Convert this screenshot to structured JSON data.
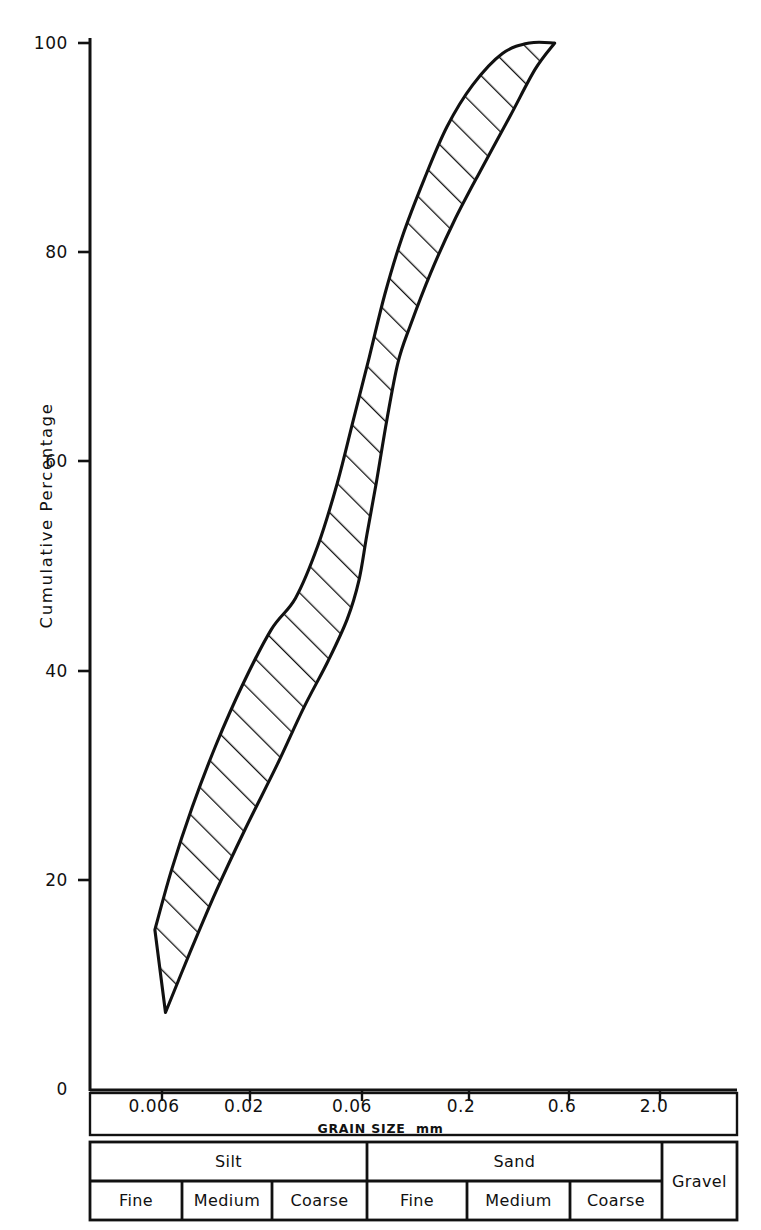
{
  "chart_data": {
    "type": "area",
    "title": "",
    "xlabel": "GRAIN SIZE  mm",
    "ylabel": "Cumulative  Percentage",
    "x_scale": "log",
    "x_ticks": [
      "0.006",
      "0.02",
      "0.06",
      "0.2",
      "0.6",
      "2.0"
    ],
    "x_tick_values": [
      0.006,
      0.02,
      0.06,
      0.2,
      0.6,
      2.0
    ],
    "y_ticks": [
      "0",
      "20",
      "40",
      "60",
      "80",
      "100"
    ],
    "y_tick_values": [
      0,
      20,
      40,
      60,
      80,
      100
    ],
    "ylim": [
      0,
      100
    ],
    "grid": false,
    "legend": "none",
    "series": [
      {
        "name": "coarse-limit (upper-left boundary)",
        "points": [
          {
            "size": 0.0062,
            "pct": 15.3
          },
          {
            "size": 0.0075,
            "pct": 21.0
          },
          {
            "size": 0.0095,
            "pct": 27.0
          },
          {
            "size": 0.0125,
            "pct": 33.0
          },
          {
            "size": 0.017,
            "pct": 38.8
          },
          {
            "size": 0.0235,
            "pct": 44.0
          },
          {
            "size": 0.031,
            "pct": 47.0
          },
          {
            "size": 0.04,
            "pct": 52.0
          },
          {
            "size": 0.05,
            "pct": 58.0
          },
          {
            "size": 0.06,
            "pct": 64.0
          },
          {
            "size": 0.072,
            "pct": 70.0
          },
          {
            "size": 0.086,
            "pct": 76.0
          },
          {
            "size": 0.105,
            "pct": 81.5
          },
          {
            "size": 0.135,
            "pct": 87.0
          },
          {
            "size": 0.175,
            "pct": 92.0
          },
          {
            "size": 0.235,
            "pct": 96.0
          },
          {
            "size": 0.33,
            "pct": 99.0
          },
          {
            "size": 0.45,
            "pct": 100.0
          },
          {
            "size": 0.6,
            "pct": 100.0
          }
        ]
      },
      {
        "name": "fine-limit (lower-right boundary)",
        "points": [
          {
            "size": 0.007,
            "pct": 7.4
          },
          {
            "size": 0.0092,
            "pct": 13.0
          },
          {
            "size": 0.0125,
            "pct": 19.0
          },
          {
            "size": 0.0175,
            "pct": 25.0
          },
          {
            "size": 0.025,
            "pct": 31.0
          },
          {
            "size": 0.034,
            "pct": 36.5
          },
          {
            "size": 0.045,
            "pct": 41.0
          },
          {
            "size": 0.056,
            "pct": 45.0
          },
          {
            "size": 0.064,
            "pct": 48.7
          },
          {
            "size": 0.07,
            "pct": 53.0
          },
          {
            "size": 0.078,
            "pct": 58.0
          },
          {
            "size": 0.088,
            "pct": 64.0
          },
          {
            "size": 0.1,
            "pct": 69.5
          },
          {
            "size": 0.115,
            "pct": 73.0
          },
          {
            "size": 0.145,
            "pct": 78.0
          },
          {
            "size": 0.19,
            "pct": 83.0
          },
          {
            "size": 0.26,
            "pct": 88.0
          },
          {
            "size": 0.36,
            "pct": 93.0
          },
          {
            "size": 0.48,
            "pct": 97.5
          },
          {
            "size": 0.6,
            "pct": 100.0
          }
        ]
      }
    ],
    "fill_pattern": "diagonal-hatch",
    "stroke_color": "#111111",
    "fill_color": "#ffffff"
  },
  "axes": {
    "y_title": "Cumulative  Percentage",
    "y_ticks": [
      "100",
      "80",
      "60",
      "40",
      "20",
      "0"
    ],
    "x_ticks": [
      "0.006",
      "0.02",
      "0.06",
      "0.2",
      "0.6",
      "2.0"
    ],
    "x_caption_main": "GRAIN SIZE",
    "x_caption_unit": "mm"
  },
  "classification": {
    "major": [
      {
        "label": "Silt"
      },
      {
        "label": "Sand"
      },
      {
        "label": "Gravel"
      }
    ],
    "minor": [
      {
        "label": "Fine"
      },
      {
        "label": "Medium"
      },
      {
        "label": "Coarse"
      },
      {
        "label": "Fine"
      },
      {
        "label": "Medium"
      },
      {
        "label": "Coarse"
      }
    ]
  },
  "colors": {
    "ink": "#111111",
    "paper": "#ffffff"
  }
}
